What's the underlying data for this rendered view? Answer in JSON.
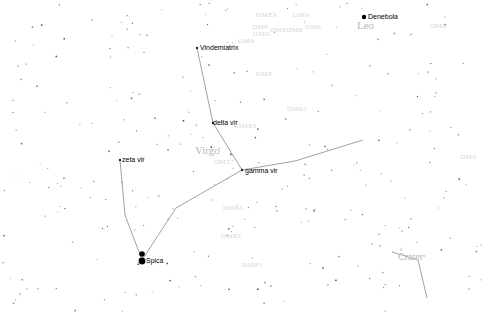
{
  "chart": {
    "constellations": [
      {
        "name": "Leo",
        "x": 357,
        "y": 25
      },
      {
        "name": "Virgo",
        "x": 195,
        "y": 150
      },
      {
        "name": "Crater",
        "x": 398,
        "y": 257
      }
    ],
    "stars": [
      {
        "name": "Vindemiatrix",
        "x": 197,
        "y": 48
      },
      {
        "name": "delta vir",
        "x": 213,
        "y": 123
      },
      {
        "name": "gamma vir",
        "x": 242,
        "y": 170
      },
      {
        "name": "zeta vir",
        "x": 120,
        "y": 160
      },
      {
        "name": "Spica",
        "x": 142,
        "y": 260
      },
      {
        "name": "Denebola",
        "x": 364,
        "y": 17
      }
    ],
    "dso_labels": [
      {
        "text": "OMES",
        "x": 256,
        "y": 16
      },
      {
        "text": "OM9",
        "x": 293,
        "y": 16
      },
      {
        "text": "OM8",
        "x": 252,
        "y": 28
      },
      {
        "text": "OM8OM8",
        "x": 270,
        "y": 31
      },
      {
        "text": "OM8",
        "x": 305,
        "y": 28
      },
      {
        "text": "OMG",
        "x": 253,
        "y": 35
      },
      {
        "text": "OM8",
        "x": 238,
        "y": 42
      },
      {
        "text": "OM8",
        "x": 256,
        "y": 75
      },
      {
        "text": "OM61",
        "x": 287,
        "y": 110
      },
      {
        "text": "OM63",
        "x": 236,
        "y": 127
      },
      {
        "text": "OM57",
        "x": 214,
        "y": 163
      },
      {
        "text": "OM85",
        "x": 223,
        "y": 209
      },
      {
        "text": "OM85",
        "x": 221,
        "y": 237
      },
      {
        "text": "OM85",
        "x": 242,
        "y": 266
      },
      {
        "text": "OM8",
        "x": 430,
        "y": 27
      },
      {
        "text": "OMS",
        "x": 460,
        "y": 158
      }
    ],
    "constellation_lines": [
      [
        [
          197,
          48
        ],
        [
          213,
          123
        ],
        [
          242,
          170
        ]
      ],
      [
        [
          242,
          170
        ],
        [
          295,
          161
        ],
        [
          363,
          140
        ]
      ],
      [
        [
          242,
          170
        ],
        [
          176,
          208
        ],
        [
          142,
          260
        ]
      ],
      [
        [
          120,
          160
        ],
        [
          125,
          215
        ],
        [
          142,
          260
        ]
      ],
      [
        [
          392,
          252
        ],
        [
          418,
          260
        ],
        [
          427,
          298
        ]
      ]
    ],
    "bright_stars": [
      {
        "x": 142,
        "y": 254,
        "r": 2.8
      },
      {
        "x": 142,
        "y": 261,
        "r": 3.4
      },
      {
        "x": 364,
        "y": 17,
        "r": 2.2
      }
    ],
    "colors": {
      "background": "#ffffff",
      "line": "#8a8a8a",
      "star": "#555555",
      "label": "#000000",
      "constellation_label": "#b8b8b8",
      "dso_label": "#d4d4d4"
    }
  }
}
